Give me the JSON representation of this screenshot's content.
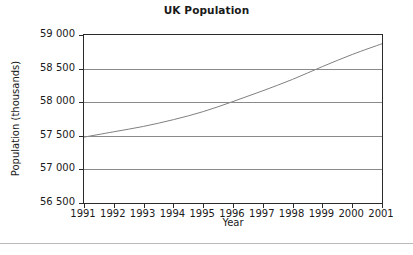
{
  "chart_data": {
    "type": "line",
    "title": "UK Population",
    "xlabel": "Year",
    "ylabel": "Population (thousands)",
    "grid": "horizontal",
    "legend": "none",
    "xlim": [
      1991,
      2001
    ],
    "ylim": [
      56500,
      59000
    ],
    "x": [
      1991,
      1992,
      1993,
      1994,
      1995,
      1996,
      1997,
      1998,
      1999,
      2000,
      2001
    ],
    "xtick_labels": [
      "1991",
      "1992",
      "1993",
      "1994",
      "1995",
      "1996",
      "1997",
      "1998",
      "1999",
      "2000",
      "2001"
    ],
    "ytick_values": [
      56500,
      57000,
      57500,
      58000,
      58500,
      59000
    ],
    "ytick_labels": [
      "56 500",
      "57 000",
      "57 500",
      "58 000",
      "58 500",
      "59 000"
    ],
    "series": [
      {
        "name": "UK Population",
        "color": "#808080",
        "values": [
          57480,
          57560,
          57640,
          57740,
          57860,
          58010,
          58170,
          58340,
          58530,
          58710,
          58870
        ]
      }
    ]
  }
}
